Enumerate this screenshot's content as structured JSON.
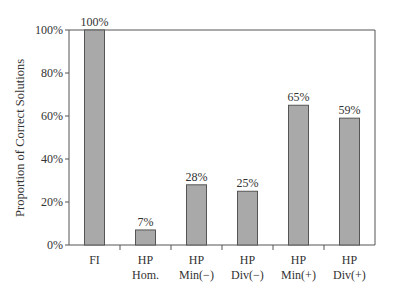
{
  "chart_data": {
    "type": "bar",
    "title": "",
    "xlabel": "",
    "ylabel": "Proportion of Correct Solutions",
    "ylim": [
      0,
      100
    ],
    "yticks": [
      "0%",
      "20%",
      "40%",
      "60%",
      "80%",
      "100%"
    ],
    "categories": [
      [
        "FI"
      ],
      [
        "HP",
        "Hom."
      ],
      [
        "HP",
        "Min(−)"
      ],
      [
        "HP",
        "Div(−)"
      ],
      [
        "HP",
        "Min(+)"
      ],
      [
        "HP",
        "Div(+)"
      ]
    ],
    "values": [
      100,
      7,
      28,
      25,
      65,
      59
    ],
    "data_labels": [
      "100%",
      "7%",
      "28%",
      "25%",
      "65%",
      "59%"
    ],
    "grid": false,
    "legend": null,
    "colors": {
      "bar_fill": "#a9a9a9",
      "bar_stroke": "#555555",
      "axis": "#555555"
    }
  }
}
